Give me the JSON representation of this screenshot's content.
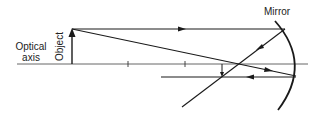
{
  "labels": {
    "mirror": "Mirror",
    "optical_axis_line1": "Optical",
    "optical_axis_line2": "axis",
    "object": "Object"
  },
  "colors": {
    "line": "#1a1a1a",
    "background": "#ffffff"
  }
}
